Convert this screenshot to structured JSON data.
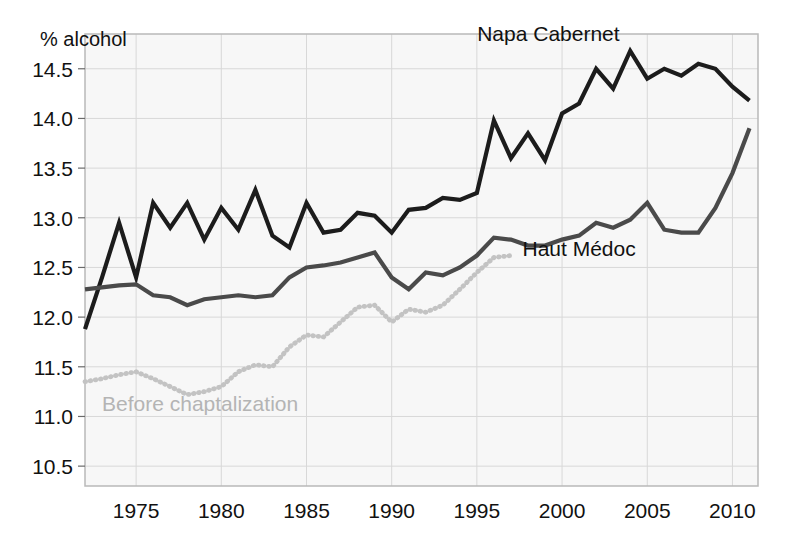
{
  "chart_data": {
    "type": "line",
    "title": "",
    "xlabel": "",
    "ylabel": "% alcohol",
    "xlim": [
      1972,
      2011.5
    ],
    "ylim": [
      10.3,
      14.85
    ],
    "grid": true,
    "legend_position": "inline-annotations",
    "x_ticks": [
      1975,
      1980,
      1985,
      1990,
      1995,
      2000,
      2005,
      2010
    ],
    "x_tick_labels": [
      "1975",
      "1980",
      "1985",
      "1990",
      "1995",
      "2000",
      "2005",
      "2010"
    ],
    "y_ticks": [
      10.5,
      11.0,
      11.5,
      12.0,
      12.5,
      13.0,
      13.5,
      14.0,
      14.5
    ],
    "y_tick_labels": [
      "10.5",
      "11.0",
      "11.5",
      "12.0",
      "12.5",
      "13.0",
      "13.5",
      "14.0",
      "14.5"
    ],
    "series": [
      {
        "name": "Napa Cabernet",
        "color": "#1c1c1c",
        "style": "solid",
        "width": 4.2,
        "label_x": 1999.2,
        "label_y": 14.78,
        "x": [
          1972,
          1973,
          1974,
          1975,
          1976,
          1977,
          1978,
          1979,
          1980,
          1981,
          1982,
          1983,
          1984,
          1985,
          1986,
          1987,
          1988,
          1989,
          1990,
          1991,
          1992,
          1993,
          1994,
          1995,
          1996,
          1997,
          1998,
          1999,
          2000,
          2001,
          2002,
          2003,
          2004,
          2005,
          2006,
          2007,
          2008,
          2009,
          2010,
          2011
        ],
        "values": [
          11.88,
          12.4,
          12.95,
          12.4,
          13.15,
          12.9,
          13.15,
          12.78,
          13.1,
          12.88,
          13.28,
          12.82,
          12.7,
          13.15,
          12.85,
          12.88,
          13.05,
          13.02,
          12.85,
          13.08,
          13.1,
          13.2,
          13.18,
          13.25,
          13.98,
          13.6,
          13.85,
          13.58,
          14.05,
          14.15,
          14.5,
          14.3,
          14.68,
          14.4,
          14.5,
          14.43,
          14.55,
          14.5,
          14.32,
          14.18
        ]
      },
      {
        "name": "Haut Médoc",
        "color": "#4a4a4a",
        "style": "solid",
        "width": 4.2,
        "label_x": 2001.0,
        "label_y": 12.62,
        "x": [
          1972,
          1973,
          1974,
          1975,
          1976,
          1977,
          1978,
          1979,
          1980,
          1981,
          1982,
          1983,
          1984,
          1985,
          1986,
          1987,
          1988,
          1989,
          1990,
          1991,
          1992,
          1993,
          1994,
          1995,
          1996,
          1997,
          1998,
          1999,
          2000,
          2001,
          2002,
          2003,
          2004,
          2005,
          2006,
          2007,
          2008,
          2009,
          2010,
          2011
        ],
        "values": [
          12.28,
          12.3,
          12.32,
          12.33,
          12.22,
          12.2,
          12.12,
          12.18,
          12.2,
          12.22,
          12.2,
          12.22,
          12.4,
          12.5,
          12.52,
          12.55,
          12.6,
          12.65,
          12.4,
          12.28,
          12.45,
          12.42,
          12.5,
          12.62,
          12.8,
          12.78,
          12.72,
          12.72,
          12.78,
          12.82,
          12.95,
          12.9,
          12.98,
          13.15,
          12.88,
          12.85,
          12.85,
          13.1,
          13.45,
          13.9
        ]
      },
      {
        "name": "Before chaptalization",
        "color": "#c3c3c3",
        "style": "dotted",
        "width": 4.2,
        "label_x": 1973.0,
        "label_y": 11.06,
        "x": [
          1972,
          1973,
          1974,
          1975,
          1976,
          1977,
          1978,
          1979,
          1980,
          1981,
          1982,
          1983,
          1984,
          1985,
          1986,
          1987,
          1988,
          1989,
          1990,
          1991,
          1992,
          1993,
          1994,
          1995,
          1996,
          1997
        ],
        "values": [
          11.35,
          11.38,
          11.42,
          11.45,
          11.38,
          11.3,
          11.22,
          11.25,
          11.3,
          11.45,
          11.52,
          11.5,
          11.7,
          11.82,
          11.8,
          11.95,
          12.1,
          12.12,
          11.95,
          12.08,
          12.05,
          12.12,
          12.28,
          12.45,
          12.6,
          12.62
        ]
      }
    ]
  },
  "axis": {
    "y_axis_title": "% alcohol"
  },
  "colors": {
    "plot_background": "#f7f7f7",
    "grid": "#d8d8d8",
    "frame": "#b9b9b9",
    "text": "#111111"
  }
}
